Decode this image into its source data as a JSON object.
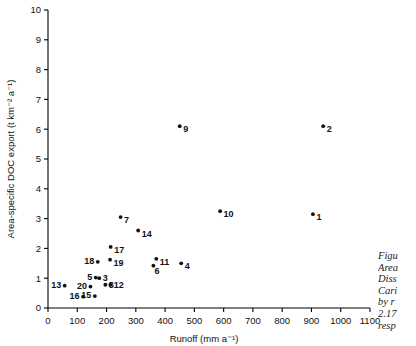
{
  "chart_data": {
    "type": "scatter",
    "title": "",
    "xlabel": "Runoff (mm a⁻¹)",
    "ylabel": "Area-specific DOC export (t km⁻² a⁻¹)",
    "xlim": [
      0,
      1100
    ],
    "ylim": [
      0,
      10
    ],
    "xticks": [
      0,
      100,
      200,
      300,
      400,
      500,
      600,
      700,
      800,
      900,
      1000,
      1100
    ],
    "yticks": [
      0,
      1,
      2,
      3,
      4,
      5,
      6,
      7,
      8,
      9,
      10
    ],
    "grid": false,
    "legend": "none",
    "points": [
      {
        "label": "1",
        "x": 905,
        "y": 3.15
      },
      {
        "label": "2",
        "x": 940,
        "y": 6.1
      },
      {
        "label": "3",
        "x": 175,
        "y": 1.0
      },
      {
        "label": "4",
        "x": 455,
        "y": 1.5
      },
      {
        "label": "5",
        "x": 163,
        "y": 1.02
      },
      {
        "label": "6",
        "x": 360,
        "y": 1.42
      },
      {
        "label": "7",
        "x": 248,
        "y": 3.05
      },
      {
        "label": "8",
        "x": 196,
        "y": 0.78
      },
      {
        "label": "9",
        "x": 450,
        "y": 6.1
      },
      {
        "label": "10",
        "x": 588,
        "y": 3.25
      },
      {
        "label": "11",
        "x": 370,
        "y": 1.65
      },
      {
        "label": "12",
        "x": 213,
        "y": 0.78
      },
      {
        "label": "13",
        "x": 57,
        "y": 0.75
      },
      {
        "label": "14",
        "x": 308,
        "y": 2.6
      },
      {
        "label": "15",
        "x": 160,
        "y": 0.4
      },
      {
        "label": "16",
        "x": 120,
        "y": 0.38
      },
      {
        "label": "17",
        "x": 214,
        "y": 2.05
      },
      {
        "label": "18",
        "x": 170,
        "y": 1.55
      },
      {
        "label": "19",
        "x": 212,
        "y": 1.62
      },
      {
        "label": "20",
        "x": 145,
        "y": 0.72
      }
    ]
  },
  "caption": {
    "lines": [
      "Figu",
      "Area",
      "Diss",
      "Cari",
      "by r",
      "2.17",
      "resp"
    ]
  }
}
